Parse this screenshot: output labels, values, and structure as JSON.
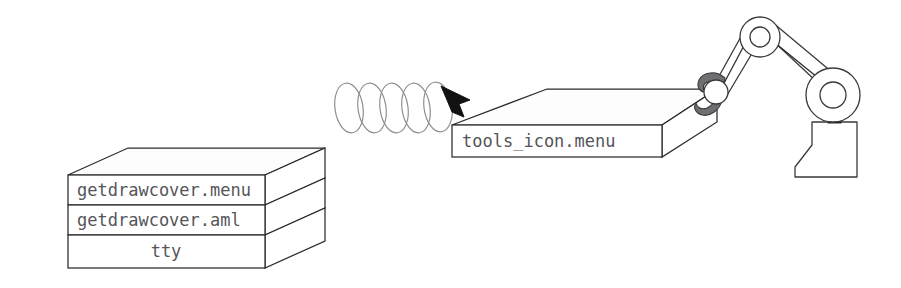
{
  "diagram": {
    "background_color": "#ffffff",
    "line_color": "#2b2b2b",
    "text_color": "#55555a",
    "coil_color": "#8a8a90",
    "arrow_color": "#121212",
    "gripper_color": "#6e6e73"
  },
  "stack": {
    "name": "layer-stack",
    "layers": [
      {
        "label": "getdrawcover.menu",
        "align": "left"
      },
      {
        "label": "getdrawcover.aml",
        "align": "left"
      },
      {
        "label": "tty",
        "align": "center"
      }
    ]
  },
  "carried_slab": {
    "name": "tools-slab",
    "label": "tools_icon.menu"
  },
  "motion": {
    "coil_icon": "spring-coil-icon",
    "coil_loops": 5,
    "arrow_icon": "arrow-down-right-icon",
    "arrow_direction": "down-right"
  },
  "robot": {
    "name": "robot-arm",
    "parts": [
      {
        "icon": "robot-base-icon",
        "label": "base pedestal"
      },
      {
        "icon": "shoulder-joint-icon",
        "label": "shoulder joint"
      },
      {
        "icon": "upper-arm-link-icon",
        "label": "upper arm link"
      },
      {
        "icon": "elbow-joint-icon",
        "label": "elbow joint"
      },
      {
        "icon": "forearm-link-icon",
        "label": "forearm link"
      },
      {
        "icon": "wrist-joint-icon",
        "label": "wrist joint"
      },
      {
        "icon": "gripper-claw-icon",
        "label": "gripper claw"
      }
    ]
  }
}
